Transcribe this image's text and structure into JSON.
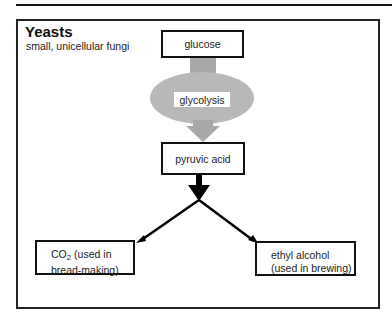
{
  "header": {
    "title": "Yeasts",
    "subtitle": "small, unicellular fungi"
  },
  "nodes": {
    "glucose": "glucose",
    "glycolysis": "glycolysis",
    "pyruvic_acid": "pyruvic acid",
    "co2": {
      "formula_main": "CO",
      "formula_sub": "2",
      "line1_rest": " (used in",
      "line2": "bread-making)"
    },
    "ethanol": {
      "line1": "ethyl alcohol",
      "line2": "(used in brewing)"
    }
  },
  "colors": {
    "border": "#111111",
    "process_fill": "#b8b8b8",
    "arrow_gray": "#a8a8a8",
    "arrow_black": "#000000"
  }
}
